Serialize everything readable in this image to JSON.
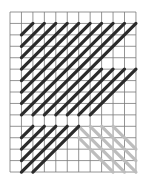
{
  "diagram": {
    "type": "needlepoint-stitch-chart",
    "grid": {
      "cols": 11,
      "rows": 14,
      "left": 10,
      "top": 12,
      "cell_w": 11.45,
      "cell_h": 11.43,
      "line_color": "#7a7a7a"
    },
    "colors": {
      "dark_stitch": "#2b2b2b",
      "light_stitch": "#bdbdbd",
      "background": "#ffffff"
    },
    "bands": [
      {
        "name": "upper-diagonal-band",
        "row_start": 1,
        "row_end": 5,
        "col_start": 1,
        "col_end": 10,
        "shade": "dark"
      },
      {
        "name": "middle-diagonal-band",
        "row_start": 5,
        "row_end": 9,
        "col_start": 1,
        "col_end": 10,
        "shade": "dark"
      },
      {
        "name": "lower-left-diagonal-band",
        "row_start": 10,
        "row_end": 14,
        "col_start": 1,
        "col_end": 5,
        "shade": "dark"
      },
      {
        "name": "lower-right-back-diagonal-band",
        "row_start": 10,
        "row_end": 14,
        "col_start": 6,
        "col_end": 10,
        "shade": "light"
      }
    ]
  }
}
